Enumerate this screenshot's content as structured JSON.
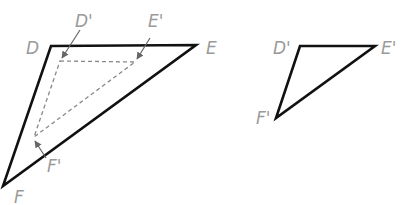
{
  "figure": {
    "left": {
      "outer_triangle": {
        "vertices": {
          "D": [
            51,
            46
          ],
          "E": [
            196,
            45
          ],
          "F": [
            3,
            186
          ]
        },
        "labels": {
          "D": "D",
          "E": "E",
          "F": "F"
        }
      },
      "inner_triangle": {
        "style": "dashed",
        "vertices": {
          "D'": [
            60,
            61
          ],
          "E'": [
            135,
            62
          ],
          "F'": [
            34,
            137
          ]
        },
        "labels": {
          "D'": "D'",
          "E'": "E'",
          "F'": "F'"
        }
      }
    },
    "right": {
      "triangle": {
        "vertices": {
          "D'": [
            300,
            46
          ],
          "E'": [
            375,
            46
          ],
          "F'": [
            276,
            118
          ]
        },
        "labels": {
          "D'": "D'",
          "E'": "E'",
          "F'": "F'"
        }
      }
    },
    "colors": {
      "stroke": "#111111",
      "dashed": "#888888",
      "label": "#9a9a9a"
    }
  }
}
